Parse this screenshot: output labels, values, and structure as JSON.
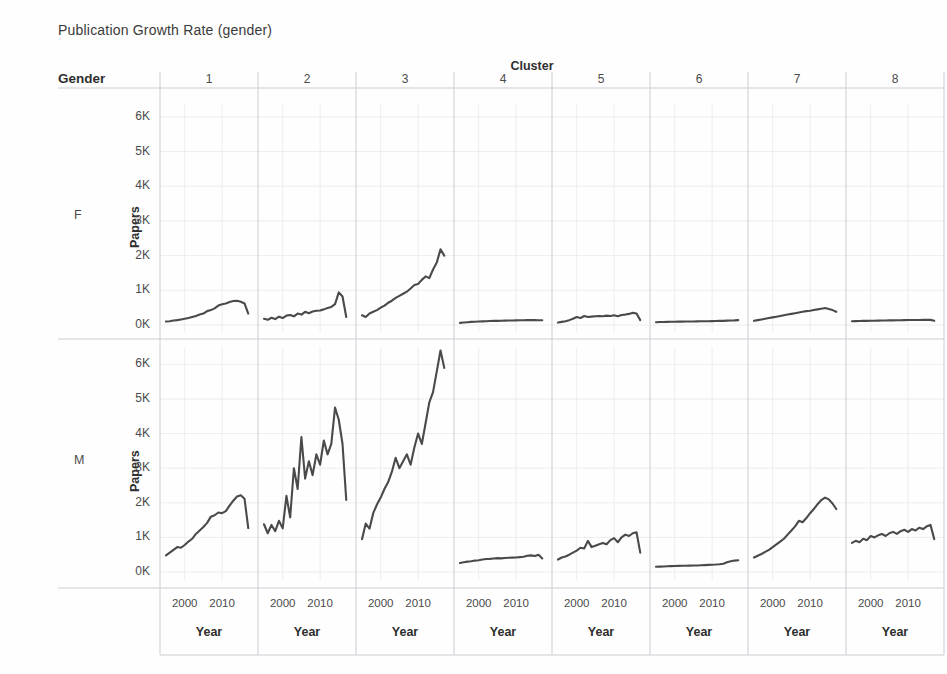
{
  "title": "Publication Growth Rate (gender)",
  "headers": {
    "gender": "Gender",
    "cluster": "Cluster"
  },
  "axes": {
    "y_title": "Papers",
    "x_title": "Year",
    "y_ticks": [
      "0K",
      "1K",
      "2K",
      "3K",
      "4K",
      "5K",
      "6K"
    ],
    "x_ticks": [
      "2000",
      "2010"
    ],
    "ylim": [
      0,
      6500
    ],
    "xlim": [
      1995,
      2018
    ],
    "grid": true
  },
  "columns": [
    {
      "label": "1"
    },
    {
      "label": "2"
    },
    {
      "label": "3"
    },
    {
      "label": "4"
    },
    {
      "label": "5"
    },
    {
      "label": "6"
    },
    {
      "label": "7"
    },
    {
      "label": "8"
    }
  ],
  "rows": [
    {
      "label": "F"
    },
    {
      "label": "M"
    }
  ],
  "colors": {
    "line": "#4a4a4a",
    "grid": "#e8e8ec",
    "axis": "#c8c8d0",
    "background": "#fefefe",
    "text": "#3d3d3d"
  },
  "chart_data": {
    "type": "line",
    "title": "Publication Growth Rate (gender)",
    "xlabel": "Year",
    "ylabel": "Papers",
    "facet_rows": "Gender",
    "facet_cols": "Cluster",
    "xlim": [
      1995,
      2018
    ],
    "ylim": [
      0,
      6500
    ],
    "grid": true,
    "legend": "none",
    "x": [
      1995,
      1996,
      1997,
      1998,
      1999,
      2000,
      2001,
      2002,
      2003,
      2004,
      2005,
      2006,
      2007,
      2008,
      2009,
      2010,
      2011,
      2012,
      2013,
      2014,
      2015,
      2016,
      2017
    ],
    "panels": [
      {
        "gender": "F",
        "cluster": "1",
        "values": [
          100,
          110,
          130,
          140,
          160,
          180,
          200,
          230,
          260,
          300,
          330,
          400,
          430,
          480,
          560,
          600,
          620,
          660,
          690,
          700,
          670,
          620,
          330
        ]
      },
      {
        "gender": "F",
        "cluster": "2",
        "values": [
          180,
          150,
          210,
          170,
          240,
          200,
          270,
          290,
          250,
          330,
          300,
          380,
          340,
          390,
          410,
          420,
          450,
          490,
          520,
          600,
          940,
          820,
          230
        ]
      },
      {
        "gender": "F",
        "cluster": "3",
        "values": [
          280,
          230,
          330,
          380,
          430,
          500,
          560,
          640,
          700,
          780,
          840,
          900,
          960,
          1050,
          1150,
          1180,
          1300,
          1400,
          1350,
          1600,
          1800,
          2180,
          2000
        ]
      },
      {
        "gender": "F",
        "cluster": "4",
        "values": [
          60,
          70,
          80,
          90,
          95,
          100,
          105,
          110,
          115,
          118,
          120,
          122,
          125,
          128,
          130,
          133,
          136,
          138,
          140,
          142,
          140,
          138,
          135
        ]
      },
      {
        "gender": "F",
        "cluster": "5",
        "values": [
          70,
          90,
          110,
          140,
          180,
          230,
          200,
          260,
          230,
          240,
          250,
          260,
          250,
          270,
          260,
          280,
          250,
          290,
          300,
          320,
          350,
          330,
          140
        ]
      },
      {
        "gender": "F",
        "cluster": "6",
        "values": [
          80,
          85,
          88,
          90,
          92,
          95,
          96,
          98,
          100,
          102,
          103,
          105,
          106,
          108,
          110,
          112,
          115,
          118,
          120,
          125,
          128,
          132,
          140
        ]
      },
      {
        "gender": "F",
        "cluster": "7",
        "values": [
          120,
          140,
          160,
          180,
          200,
          220,
          240,
          260,
          280,
          300,
          320,
          340,
          360,
          380,
          400,
          410,
          430,
          450,
          470,
          490,
          460,
          430,
          380
        ]
      },
      {
        "gender": "F",
        "cluster": "8",
        "values": [
          110,
          112,
          115,
          118,
          120,
          122,
          124,
          126,
          128,
          130,
          132,
          134,
          136,
          138,
          140,
          142,
          143,
          145,
          146,
          148,
          150,
          148,
          120
        ]
      },
      {
        "gender": "M",
        "cluster": "1",
        "values": [
          480,
          560,
          640,
          720,
          700,
          780,
          880,
          960,
          1100,
          1200,
          1300,
          1420,
          1600,
          1640,
          1720,
          1700,
          1760,
          1920,
          2060,
          2180,
          2220,
          2120,
          1270
        ]
      },
      {
        "gender": "M",
        "cluster": "2",
        "values": [
          1380,
          1120,
          1360,
          1180,
          1480,
          1260,
          2200,
          1580,
          3000,
          2400,
          3900,
          2700,
          3200,
          2800,
          3400,
          3100,
          3800,
          3400,
          3700,
          4750,
          4400,
          3700,
          2080
        ]
      },
      {
        "gender": "M",
        "cluster": "3",
        "values": [
          950,
          1400,
          1250,
          1700,
          1950,
          2150,
          2400,
          2600,
          2900,
          3300,
          3000,
          3200,
          3400,
          3100,
          3600,
          4000,
          3700,
          4300,
          4900,
          5200,
          5800,
          6400,
          5900
        ]
      },
      {
        "gender": "M",
        "cluster": "4",
        "values": [
          260,
          280,
          300,
          310,
          330,
          340,
          360,
          375,
          380,
          390,
          400,
          395,
          405,
          410,
          415,
          420,
          430,
          440,
          470,
          480,
          460,
          500,
          390
        ]
      },
      {
        "gender": "M",
        "cluster": "5",
        "values": [
          360,
          420,
          450,
          500,
          560,
          620,
          700,
          680,
          900,
          720,
          760,
          800,
          840,
          800,
          920,
          980,
          860,
          1000,
          1080,
          1040,
          1120,
          1150,
          560
        ]
      },
      {
        "gender": "M",
        "cluster": "6",
        "values": [
          150,
          155,
          160,
          165,
          170,
          175,
          178,
          180,
          182,
          185,
          188,
          190,
          195,
          200,
          205,
          210,
          215,
          225,
          240,
          280,
          310,
          330,
          340
        ]
      },
      {
        "gender": "M",
        "cluster": "7",
        "values": [
          420,
          470,
          520,
          580,
          640,
          720,
          800,
          880,
          960,
          1080,
          1200,
          1320,
          1480,
          1440,
          1560,
          1700,
          1820,
          1960,
          2080,
          2150,
          2100,
          1980,
          1820
        ]
      },
      {
        "gender": "M",
        "cluster": "8",
        "values": [
          840,
          900,
          860,
          960,
          920,
          1040,
          1000,
          1060,
          1100,
          1040,
          1120,
          1160,
          1100,
          1180,
          1220,
          1160,
          1240,
          1200,
          1280,
          1240,
          1320,
          1360,
          950
        ]
      }
    ]
  }
}
